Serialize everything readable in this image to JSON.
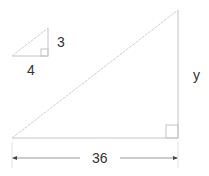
{
  "diagram": {
    "small_triangle": {
      "height_label": "3",
      "base_label": "4"
    },
    "large_triangle": {
      "height_label": "y",
      "base_label": "36"
    },
    "colors": {
      "line": "#c8c8c8",
      "text": "#333333",
      "arrow": "#444444"
    }
  }
}
